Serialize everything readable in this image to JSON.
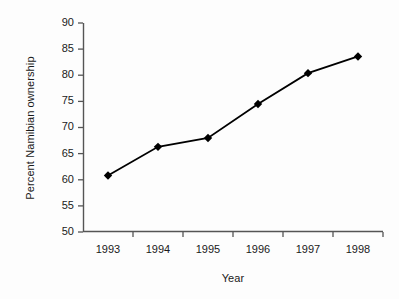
{
  "chart_data": {
    "type": "line",
    "title": "",
    "subtitle": "",
    "xlabel": "Year",
    "ylabel": "Percent Namibian ownership",
    "categories": [
      "1993",
      "1994",
      "1995",
      "1996",
      "1997",
      "1998"
    ],
    "x": [
      1993,
      1994,
      1995,
      1996,
      1997,
      1998
    ],
    "values": [
      60.8,
      66.3,
      68.0,
      74.5,
      80.4,
      83.6
    ],
    "series": [
      {
        "name": "Percent Namibian ownership",
        "values": [
          60.8,
          66.3,
          68.0,
          74.5,
          80.4,
          83.6
        ]
      }
    ],
    "ylim": [
      50,
      90
    ],
    "ytick_step": 5,
    "yticks": [
      50,
      55,
      60,
      65,
      70,
      75,
      80,
      85,
      90
    ],
    "ytick_labels": [
      "50",
      "55",
      "60",
      "65",
      "70",
      "75",
      "80",
      "85",
      "90"
    ],
    "xtick_labels": [
      "1993",
      "1994",
      "1995",
      "1996",
      "1997",
      "1998"
    ],
    "grid": false,
    "legend": false,
    "legend_position": "none",
    "marker": "diamond",
    "line_color": "#000000",
    "marker_color": "#000000",
    "axis_color": "#555555",
    "background_color": "#fdfdfd",
    "annotations": []
  }
}
